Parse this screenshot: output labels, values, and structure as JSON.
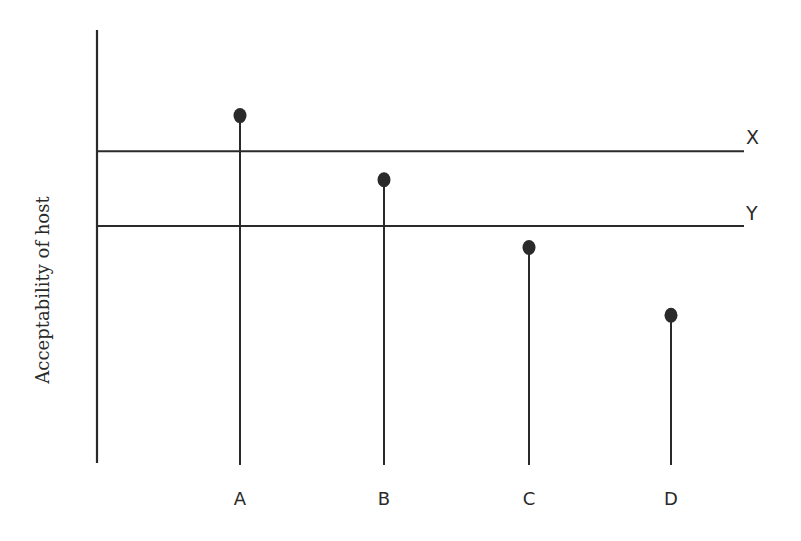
{
  "chart_data": {
    "type": "scatter",
    "style": "lollipop",
    "title": "",
    "xlabel": "",
    "ylabel": "Acceptability of host",
    "categories": [
      "A",
      "B",
      "C",
      "D"
    ],
    "values": [
      4.9,
      4.0,
      3.05,
      2.1
    ],
    "ylim": [
      0,
      6.1
    ],
    "reference_lines": [
      {
        "label": "X",
        "value": 4.4
      },
      {
        "label": "Y",
        "value": 3.35
      }
    ],
    "grid": false,
    "legend": null,
    "y_ticks": false,
    "color": "#2a2a2a"
  },
  "axis": {
    "ylabel": "Acceptability of host"
  },
  "categories": [
    "A",
    "B",
    "C",
    "D"
  ],
  "reference_labels": {
    "x": "X",
    "y": "Y"
  }
}
